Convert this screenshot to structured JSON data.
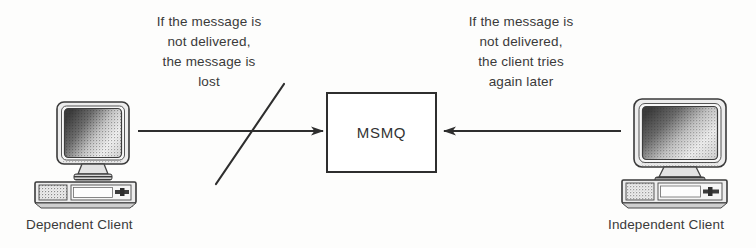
{
  "diagram": {
    "title_text": "MSMQ dependent vs independent client message delivery",
    "background_color": "#fdfdfc",
    "ink_color": "#2e2e2e",
    "center_node": {
      "label": "MSMQ",
      "shape": "rectangle",
      "border_color": "#2e2e2e",
      "fill_color": "#ffffff"
    },
    "left": {
      "caption_lines": [
        "If the message is",
        "not delivered,",
        "the message is",
        "lost"
      ],
      "node_label": "Dependent Client",
      "icon": "desktop-computer-icon",
      "arrow": {
        "name": "arrow-dependent-to-msmq",
        "direction": "right",
        "crossed_out": true,
        "cross_mark": "diagonal-slash"
      }
    },
    "right": {
      "caption_lines": [
        "If the message is",
        "not delivered,",
        "the client tries",
        "again later"
      ],
      "node_label": "Independent Client",
      "icon": "desktop-computer-icon",
      "arrow": {
        "name": "arrow-independent-to-msmq",
        "direction": "left",
        "crossed_out": false,
        "cross_mark": ""
      }
    }
  }
}
